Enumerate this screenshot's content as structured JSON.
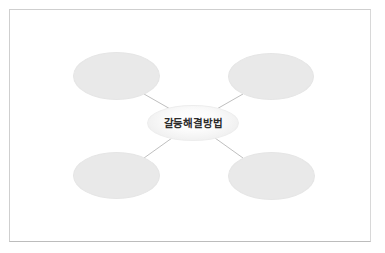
{
  "diagram": {
    "type": "mind-map",
    "center": {
      "id": "center",
      "label": "갈등해결방법"
    },
    "branches": [
      {
        "id": "top-left",
        "label": "",
        "position": "top-left"
      },
      {
        "id": "top-right",
        "label": "",
        "position": "top-right"
      },
      {
        "id": "bottom-left",
        "label": "",
        "position": "bottom-left"
      },
      {
        "id": "bottom-right",
        "label": "",
        "position": "bottom-right"
      }
    ],
    "colors": {
      "page_background": "#ffffff",
      "frame_border": "#cfcfcf",
      "branch_fill": "#e9e9e9",
      "center_fill": "#fbfbfb",
      "connector_line": "#b8b8b8",
      "center_text": "#2b2b2b"
    },
    "connectors": [
      {
        "from": "top-left",
        "to": "center"
      },
      {
        "from": "top-right",
        "to": "center"
      },
      {
        "from": "bottom-left",
        "to": "center"
      },
      {
        "from": "bottom-right",
        "to": "center"
      }
    ]
  }
}
